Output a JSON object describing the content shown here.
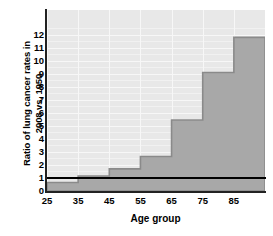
{
  "chart_data": {
    "type": "area",
    "title": "",
    "xlabel": "Age group",
    "ylabel": "Ratio of lung cancer rates in\n2008 vs. 1950",
    "x_tick_labels": [
      "25",
      "35",
      "45",
      "55",
      "65",
      "75",
      "85"
    ],
    "x_tick_values": [
      25,
      35,
      45,
      55,
      65,
      75,
      85
    ],
    "y_tick_labels": [
      "0",
      "1",
      "2",
      "3",
      "4",
      "5",
      "6",
      "7",
      "8",
      "9",
      "10",
      "11",
      "12"
    ],
    "y_tick_values": [
      0,
      1,
      2,
      3,
      4,
      5,
      6,
      7,
      8,
      9,
      10,
      11,
      12
    ],
    "xlim": [
      25,
      95
    ],
    "ylim": [
      0,
      13.9
    ],
    "grid": true,
    "legend": "none",
    "categories": [
      "25-34",
      "35-44",
      "45-54",
      "55-64",
      "65-74",
      "75-84",
      "85+"
    ],
    "step_starts": [
      25,
      35,
      45,
      55,
      65,
      75,
      85
    ],
    "step_ends": [
      35,
      45,
      55,
      65,
      75,
      85,
      95
    ],
    "values": [
      0.65,
      1.15,
      1.7,
      2.65,
      5.45,
      9.1,
      11.8
    ],
    "reference_line": {
      "value": 1,
      "label": "no change (ratio = 1)",
      "color": "#000000"
    },
    "colors": {
      "plot_background": "#e8e8e8",
      "gridline": "#f7f7f7",
      "area_fill": "#a8a8a8",
      "area_edge": "#8a8a8a",
      "axis": "#222222",
      "text": "#000000"
    }
  }
}
